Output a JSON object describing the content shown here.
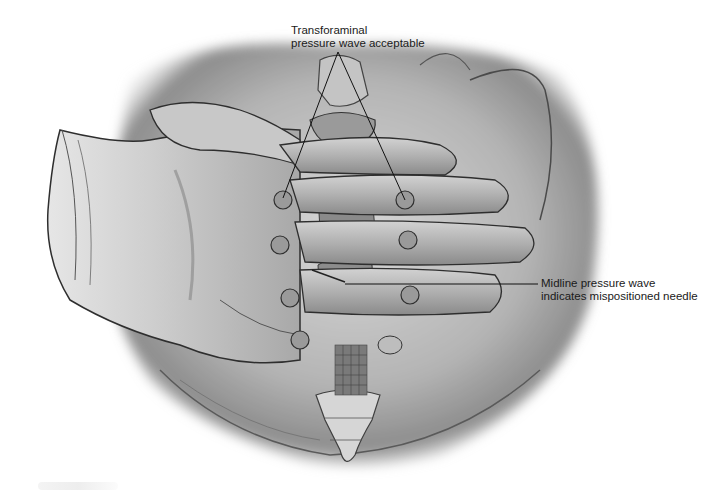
{
  "figure": {
    "type": "medical-illustration",
    "palette": {
      "background": "#ffffff",
      "ink": "#1a1a1a",
      "shade_dark": "#4a4a4a",
      "shade_mid": "#8a8a8a",
      "shade_light": "#c8c8c8"
    }
  },
  "annotations": {
    "transforaminal": {
      "line1": "Transforaminal",
      "line2": "pressure wave acceptable"
    },
    "midline": {
      "line1": "Midline pressure wave",
      "line2": "indicates mispositioned needle"
    }
  },
  "leader_lines": [
    {
      "name": "transforaminal-left",
      "x1": 338,
      "y1": 52,
      "x2": 283,
      "y2": 198
    },
    {
      "name": "transforaminal-right",
      "x1": 338,
      "y1": 52,
      "x2": 405,
      "y2": 200
    },
    {
      "name": "midline",
      "x1": 345,
      "y1": 284,
      "x2": 538,
      "y2": 284
    }
  ]
}
